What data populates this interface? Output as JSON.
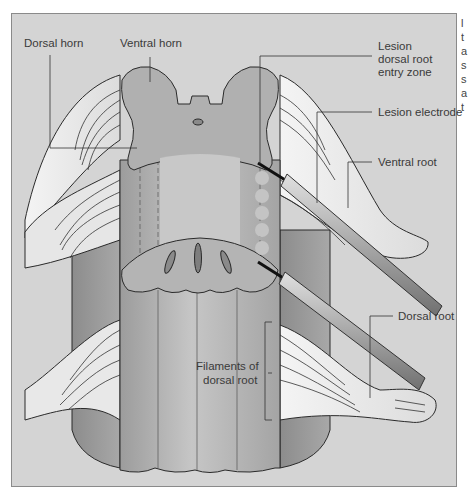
{
  "figure": {
    "background_color": "#d4d4d4",
    "labels": {
      "dorsal_horn": "Dorsal horn",
      "ventral_horn": "Ventral horn",
      "lesion_line1": "Lesion",
      "lesion_line2": "dorsal root",
      "lesion_line3": "entry zone",
      "lesion_electrode": "Lesion electrode",
      "ventral_root": "Ventral root",
      "dorsal_root": "Dorsal root",
      "filaments_line1": "Filaments of",
      "filaments_line2": "dorsal root"
    },
    "cutoff_text": [
      "l",
      "t",
      "a",
      "s",
      "s",
      "a",
      "t"
    ]
  }
}
